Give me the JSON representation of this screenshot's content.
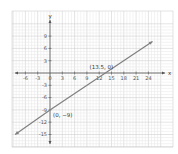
{
  "chart_data": {
    "type": "line",
    "title": "",
    "xlabel": "x",
    "ylabel": "y",
    "xlim": [
      -8,
      27
    ],
    "ylim": [
      -17,
      12
    ],
    "grid": true,
    "x_ticks": [
      -6,
      -3,
      0,
      3,
      6,
      9,
      12,
      15,
      18,
      21,
      24
    ],
    "y_ticks": [
      9,
      6,
      3,
      -3,
      -6,
      -9,
      -12,
      -15
    ],
    "x_tick_labels": [
      "-6",
      "-3",
      "0",
      "3",
      "6",
      "9",
      "12",
      "15",
      "18",
      "21",
      "24"
    ],
    "y_tick_labels": [
      "9",
      "6",
      "3",
      "-3",
      "-6",
      "-9",
      "-12",
      "-15"
    ],
    "series": [
      {
        "name": "line",
        "color": "#808080",
        "x": [
          -8.5,
          0,
          13.5,
          25
        ],
        "y": [
          -15,
          -9,
          0,
          7.7
        ]
      }
    ],
    "annotations": [
      {
        "text": "(13.5, 0)",
        "x": 13.5,
        "y": 0
      },
      {
        "text": "(0, −9)",
        "x": 0,
        "y": -9
      }
    ]
  }
}
